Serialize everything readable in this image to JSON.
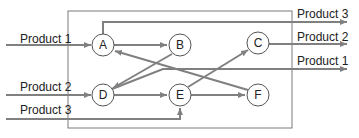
{
  "diagram": {
    "colors": {
      "line": "#808080",
      "box": "#7a7a7a",
      "node_stroke": "#555555",
      "text": "#222222"
    },
    "inputs": [
      {
        "label": "Product 1",
        "target": "A"
      },
      {
        "label": "Product 2",
        "target": "D"
      },
      {
        "label": "Product 3",
        "target": "E"
      }
    ],
    "outputs": [
      {
        "label": "Product 3",
        "source": "A"
      },
      {
        "label": "Product 2",
        "source": "C"
      },
      {
        "label": "Product 1",
        "source": "D"
      }
    ],
    "nodes": [
      {
        "id": "A",
        "label": "A"
      },
      {
        "id": "B",
        "label": "B"
      },
      {
        "id": "C",
        "label": "C"
      },
      {
        "id": "D",
        "label": "D"
      },
      {
        "id": "E",
        "label": "E"
      },
      {
        "id": "F",
        "label": "F"
      }
    ],
    "edges": [
      {
        "from": "A",
        "to": "B"
      },
      {
        "from": "F",
        "to": "A"
      },
      {
        "from": "B",
        "to": "D"
      },
      {
        "from": "D",
        "to": "E"
      },
      {
        "from": "E",
        "to": "C"
      },
      {
        "from": "E",
        "to": "F"
      }
    ]
  }
}
